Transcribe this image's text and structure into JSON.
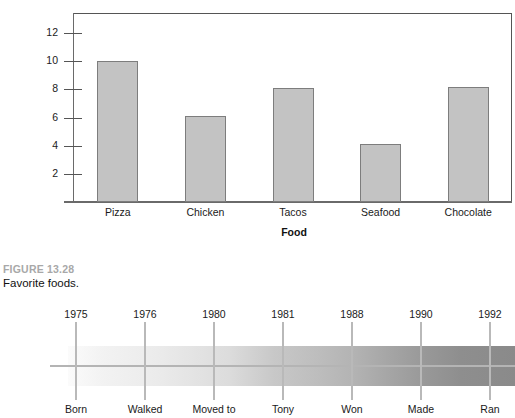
{
  "chart_data": [
    {
      "type": "bar",
      "title": "",
      "xlabel": "Food",
      "ylabel": "",
      "categories": [
        "Pizza",
        "Chicken",
        "Tacos",
        "Seafood",
        "Chocolate"
      ],
      "values": [
        10.0,
        6.1,
        8.1,
        4.1,
        8.2
      ],
      "yticks": [
        2,
        4,
        6,
        8,
        10,
        12
      ],
      "ylim": [
        0,
        13
      ],
      "grid": false,
      "legend": "none",
      "bar_fill": "#c3c3c3",
      "bar_border": "#7d7d7d"
    },
    {
      "type": "timeline",
      "title": "",
      "x": [
        "1975",
        "1976",
        "1980",
        "1981",
        "1988",
        "1990",
        "1992"
      ],
      "labels": [
        "Born",
        "Walked",
        "Moved to",
        "Tony",
        "Won",
        "Made",
        "Ran"
      ],
      "band_gradient_from": "#fbfbfb",
      "band_gradient_to": "#8a8a8a",
      "tick_color": "#b9b9b9"
    }
  ],
  "bar_chart": {
    "axis_title": "Food",
    "y_ticks": [
      {
        "label": "12"
      },
      {
        "label": "10"
      },
      {
        "label": "8"
      },
      {
        "label": "6"
      },
      {
        "label": "4"
      },
      {
        "label": "2"
      }
    ],
    "bars": [
      {
        "label": "Pizza",
        "value": "10.0"
      },
      {
        "label": "Chicken",
        "value": "6.1"
      },
      {
        "label": "Tacos",
        "value": "8.1"
      },
      {
        "label": "Seafood",
        "value": "4.1"
      },
      {
        "label": "Chocolate",
        "value": "8.2"
      }
    ]
  },
  "caption": {
    "figure_number": "FIGURE 13.28",
    "figure_title": "Favorite foods."
  },
  "timeline": {
    "points": [
      {
        "year": "1975",
        "event": "Born"
      },
      {
        "year": "1976",
        "event": "Walked"
      },
      {
        "year": "1980",
        "event": "Moved to"
      },
      {
        "year": "1981",
        "event": "Tony"
      },
      {
        "year": "1988",
        "event": "Won"
      },
      {
        "year": "1990",
        "event": "Made"
      },
      {
        "year": "1992",
        "event": "Ran"
      }
    ]
  },
  "colors": {
    "bar_fill": "#c3c3c3",
    "bar_border": "#7d7d7d",
    "axis": "#555555",
    "figure_number": "#a8a8a8",
    "text": "#111111",
    "timeline_tick": "#b9b9b9",
    "timeline_baseline": "#b4b4b4"
  }
}
